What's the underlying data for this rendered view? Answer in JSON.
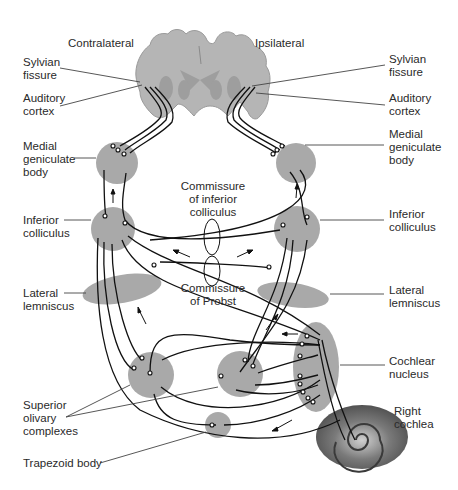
{
  "figure": {
    "side_labels": {
      "contralateral": "Contralateral",
      "ipsilateral": "Ipsilateral"
    },
    "left_labels": [
      {
        "id": "sylvian-fissure-left",
        "text": "Sylvian\nfissure"
      },
      {
        "id": "auditory-cortex-left",
        "text": "Auditory\ncortex"
      },
      {
        "id": "medial-geniculate-left",
        "text": "Medial\ngeniculate\nbody"
      },
      {
        "id": "inferior-colliculus-left",
        "text": "Inferior\ncolliculus"
      },
      {
        "id": "lateral-lemniscus-left",
        "text": "Lateral\nlemniscus"
      },
      {
        "id": "superior-olivary-complexes",
        "text": "Superior\nolivary\ncomplexes"
      },
      {
        "id": "trapezoid-body",
        "text": "Trapezoid body"
      }
    ],
    "right_labels": [
      {
        "id": "sylvian-fissure-right",
        "text": "Sylvian\nfissure"
      },
      {
        "id": "auditory-cortex-right",
        "text": "Auditory\ncortex"
      },
      {
        "id": "medial-geniculate-right",
        "text": "Medial\ngeniculate\nbody"
      },
      {
        "id": "inferior-colliculus-right",
        "text": "Inferior\ncolliculus"
      },
      {
        "id": "lateral-lemniscus-right",
        "text": "Lateral\nlemniscus"
      },
      {
        "id": "cochlear-nucleus",
        "text": "Cochlear\nnucleus"
      },
      {
        "id": "right-cochlea",
        "text": "Right\ncochlea"
      }
    ],
    "center_labels": [
      {
        "id": "commissure-inferior-colliculus",
        "text": "Commissure\nof inferior\ncolliculus"
      },
      {
        "id": "commissure-probst",
        "text": "Commissure\nof Probst"
      }
    ],
    "colors": {
      "nucleus_fill": "#a9a9a9",
      "brain_fill": "#b5b5b5",
      "fiber_stroke": "#111111",
      "background": "#ffffff"
    }
  }
}
